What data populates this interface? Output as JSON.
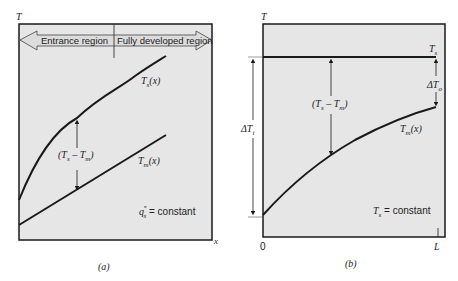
{
  "panel_a": {
    "axis_y_label": "T",
    "axis_x_label": "x",
    "region_left": "Entrance region",
    "region_right": "Fully developed region",
    "curve_ts_label": "T",
    "curve_ts_sub": "s",
    "curve_ts_arg": "(x)",
    "curve_tm_label": "T",
    "curve_tm_sub": "m",
    "curve_tm_arg": "(x)",
    "difference_label": "(T",
    "difference_sub1": "s",
    "difference_mid": " – T",
    "difference_sub2": "m",
    "difference_end": ")",
    "condition_q": "q",
    "condition_sup": "″",
    "condition_sub": "s",
    "condition_text": " = constant",
    "caption": "(a)"
  },
  "panel_b": {
    "axis_y_label": "T",
    "tick_0": "0",
    "tick_L": "L",
    "line_ts_label": "T",
    "line_ts_sub": "s",
    "curve_tm_label": "T",
    "curve_tm_sub": "m",
    "curve_tm_arg": "(x)",
    "delta_in": "ΔT",
    "delta_in_sub": "i",
    "delta_out": "ΔT",
    "delta_out_sub": "o",
    "difference_label": "(T",
    "difference_sub1": "s",
    "difference_mid": " – T",
    "difference_sub2": "m",
    "difference_end": ")",
    "condition_t": "T",
    "condition_sub": "s",
    "condition_text": " = constant",
    "caption": "(b)"
  },
  "colors": {
    "plot_bg": "#e6e6e6",
    "line": "#1a1a1a",
    "band": "#d9d9d9"
  }
}
